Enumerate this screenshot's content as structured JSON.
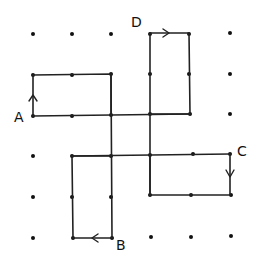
{
  "diagram": {
    "type": "dot-grid path figure",
    "grid": {
      "columns": [
        33,
        72,
        111,
        150,
        189,
        230
      ],
      "rows": [
        34,
        75,
        116,
        156,
        197,
        237
      ]
    },
    "labels": {
      "A": "A",
      "B": "B",
      "C": "C",
      "D": "D"
    },
    "paths": [
      {
        "name": "arm-A",
        "from": "A",
        "points": [
          [
            0,
            2
          ],
          [
            0,
            1
          ],
          [
            2,
            1
          ],
          [
            2,
            2
          ]
        ],
        "arrow": "up on left edge"
      },
      {
        "name": "arm-D",
        "from": "D",
        "points": [
          [
            3,
            0
          ],
          [
            4,
            0
          ],
          [
            4,
            2
          ],
          [
            3,
            2
          ]
        ],
        "arrow": "right on top edge"
      },
      {
        "name": "arm-C",
        "from": "C",
        "points": [
          [
            5,
            3
          ],
          [
            5,
            4
          ],
          [
            3,
            4
          ],
          [
            3,
            3
          ]
        ],
        "arrow": "down on right edge"
      },
      {
        "name": "arm-B",
        "from": "B",
        "points": [
          [
            2,
            5
          ],
          [
            1,
            5
          ],
          [
            1,
            3
          ],
          [
            2,
            3
          ]
        ],
        "arrow": "left on bottom edge"
      }
    ]
  }
}
